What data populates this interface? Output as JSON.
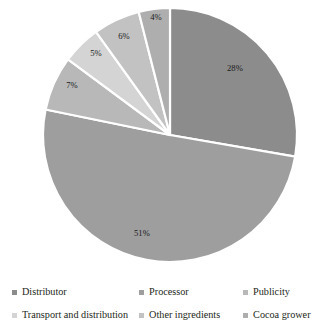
{
  "chart_data": {
    "type": "pie",
    "title": "",
    "categories": [
      "Distributor",
      "Processor",
      "Publicity",
      "Transport and distribution",
      "Other ingredients",
      "Cocoa grower"
    ],
    "values": [
      28,
      51,
      7,
      5,
      6,
      4
    ],
    "value_labels": [
      "28%",
      "51%",
      "7%",
      "5%",
      "6%",
      "4%"
    ],
    "unit": "%",
    "start_angle_deg": 0,
    "direction": "clockwise",
    "legend_position": "bottom",
    "grid": false,
    "slice_colors": [
      "#8c8c8c",
      "#9e9e9e",
      "#b8b8b8",
      "#d4d4d4",
      "#c2c2c2",
      "#aeaeae"
    ],
    "separator_color": "#ffffff"
  },
  "pie": {
    "labels": [
      {
        "text": "28%",
        "x": 235,
        "y": 69
      },
      {
        "text": "51%",
        "x": 142,
        "y": 234
      },
      {
        "text": "7%",
        "x": 72,
        "y": 86
      },
      {
        "text": "5%",
        "x": 96,
        "y": 54
      },
      {
        "text": "6%",
        "x": 124,
        "y": 37
      },
      {
        "text": "4%",
        "x": 156,
        "y": 18
      }
    ]
  },
  "legend": {
    "rows": [
      [
        {
          "label": "Distributor",
          "color": "#8c8c8c"
        },
        {
          "label": "Processor",
          "color": "#9e9e9e"
        },
        {
          "label": "Publicity",
          "color": "#b8b8b8"
        }
      ],
      [
        {
          "label": "Transport and distribution",
          "color": "#d4d4d4"
        },
        {
          "label": "Other ingredients",
          "color": "#c2c2c2"
        },
        {
          "label": "Cocoa grower",
          "color": "#aeaeae"
        }
      ]
    ]
  }
}
